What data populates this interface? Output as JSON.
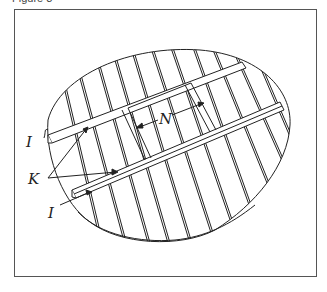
{
  "figure": {
    "caption": "Figure 3"
  },
  "diagram": {
    "labels": {
      "cleat_end_top": "I",
      "cleat_end_bottom": "I",
      "cleats": "K",
      "brace_width": "N"
    },
    "stroke_color": "#222222",
    "background": "#ffffff"
  }
}
